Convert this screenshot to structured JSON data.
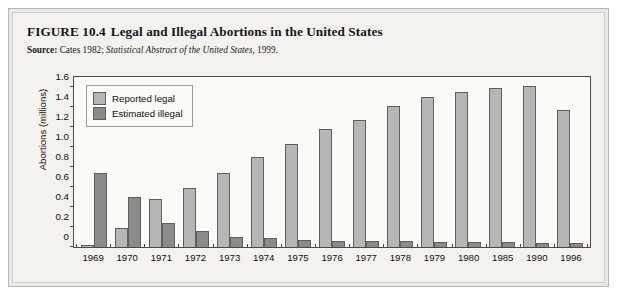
{
  "figure": {
    "number": "FIGURE 10.4",
    "title": "Legal and Illegal Abortions in the United States",
    "source_label": "Source:",
    "source_text_plain": "Cates 1982;",
    "source_text_italic": "Statistical Abstract of the United States,",
    "source_year": "1999."
  },
  "colors": {
    "legal": "#b6b6b4",
    "illegal": "#8b8b89",
    "bar_outline": "#5f5f5f",
    "frame": "#e9e9e6",
    "panel": "#fbfaf7"
  },
  "chart_data": {
    "type": "bar",
    "title": "Legal and Illegal Abortions in the United States",
    "xlabel": "",
    "ylabel": "Abortions (millions)",
    "ylim": [
      0,
      1.7
    ],
    "yticks": [
      0,
      0.2,
      0.4,
      0.6,
      0.8,
      1.0,
      1.2,
      1.4,
      1.6
    ],
    "ytick_labels": [
      "0",
      "0.2",
      "0.4",
      "0.6",
      "0.8",
      "1.0",
      "1.2",
      "1.4",
      "1.6"
    ],
    "grid": false,
    "legend_position": "top-left",
    "categories": [
      "1969",
      "1970",
      "1971",
      "1972",
      "1973",
      "1974",
      "1975",
      "1976",
      "1977",
      "1978",
      "1979",
      "1980",
      "1985",
      "1990",
      "1996"
    ],
    "series": [
      {
        "name": "Reported legal",
        "color": "#b6b6b4",
        "values": [
          0.02,
          0.19,
          0.48,
          0.59,
          0.74,
          0.9,
          1.03,
          1.18,
          1.27,
          1.41,
          1.5,
          1.55,
          1.59,
          1.61,
          1.37
        ]
      },
      {
        "name": "Estimated illegal",
        "color": "#8b8b89",
        "values": [
          0.74,
          0.5,
          0.24,
          0.16,
          0.1,
          0.09,
          0.07,
          0.06,
          0.06,
          0.06,
          0.05,
          0.05,
          0.05,
          0.04,
          0.04
        ]
      }
    ]
  }
}
